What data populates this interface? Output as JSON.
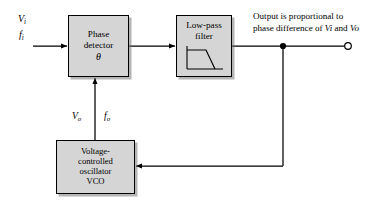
{
  "diagram": {
    "type": "block-diagram",
    "background_color": "#ffffff",
    "line_color": "#000000",
    "box_fill_color": "#d5d5d5",
    "box_border_color": "#000000"
  },
  "inputs": {
    "voltage_label": "V",
    "voltage_sub": "i",
    "frequency_label": "f",
    "frequency_sub": "i"
  },
  "blocks": {
    "phase_detector": {
      "line1": "Phase",
      "line2": "detector",
      "symbol": "θ"
    },
    "low_pass_filter": {
      "line1": "Low-pass",
      "line2": "filter",
      "icon": "low-pass-response-curve-icon"
    },
    "vco": {
      "line1": "Voltage-",
      "line2": "controlled",
      "line3": "oscillator",
      "line4": "VCO"
    }
  },
  "feedback": {
    "voltage_label": "V",
    "voltage_sub": "o",
    "frequency_label": "f",
    "frequency_sub": "o"
  },
  "output": {
    "note_line1": "Output is proportional to",
    "note_line2_prefix": "phase difference of ",
    "note_v1": "V",
    "note_v1_sub": "i",
    "note_conjunction": " and ",
    "note_v2": "V",
    "note_v2_sub": "o",
    "terminal": "open-circle-terminal",
    "junction": "solid-junction-dot"
  },
  "icons": {
    "arrowhead": "arrowhead-icon",
    "junction_dot": "junction-dot-icon",
    "output_terminal": "open-terminal-circle-icon",
    "filter_curve": "filter-response-curve-icon"
  }
}
